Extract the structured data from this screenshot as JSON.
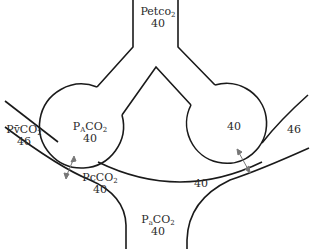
{
  "diagram": {
    "colors": {
      "stroke": "#1a1a1a",
      "arrow": "#777777",
      "text": "#2a2a2a"
    },
    "labels": {
      "end_tidal": {
        "prefix": "Petco",
        "sub": "2",
        "value": "40"
      },
      "alveolar": {
        "prefix": "P",
        "sub1": "A",
        "mid": "CO",
        "sub2": "2",
        "value": "40"
      },
      "right_alveolus": {
        "value": "40"
      },
      "mixed_venous": {
        "prefix": "Pv̄CO",
        "sub": "2",
        "value": "46"
      },
      "right_venous": {
        "value": "46"
      },
      "capillary": {
        "prefix": "PcCO",
        "sub": "2",
        "value": "40"
      },
      "right_capillary": {
        "value": "40"
      },
      "arterial": {
        "prefix": "P",
        "sub1": "a",
        "mid": "CO",
        "sub2": "2",
        "value": "40"
      }
    }
  }
}
